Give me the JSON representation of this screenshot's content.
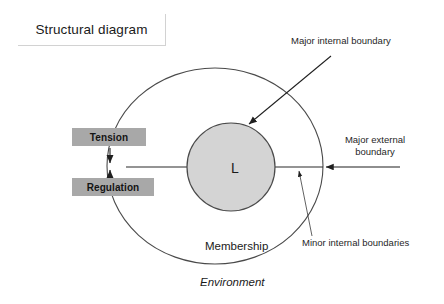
{
  "title": {
    "text": "Structural diagram"
  },
  "diagram": {
    "core": {
      "label": "L",
      "fill_color": "#d4d4d4",
      "stroke_color": "#4a4a4a"
    },
    "outer_circle": {
      "label": "Membership",
      "stroke_color": "#4a4a4a",
      "fill_color": "#ffffff"
    },
    "environment_label": "Environment",
    "boxes": [
      {
        "id": "tension",
        "label": "Tension",
        "fill_color": "#a8a8a8"
      },
      {
        "id": "regulation",
        "label": "Regulation",
        "fill_color": "#a8a8a8"
      }
    ],
    "annotations": [
      {
        "id": "major-internal",
        "label": "Major internal boundary"
      },
      {
        "id": "major-external",
        "label": "Major external boundary"
      },
      {
        "id": "minor-internal",
        "label": "Minor internal boundaries"
      }
    ]
  }
}
